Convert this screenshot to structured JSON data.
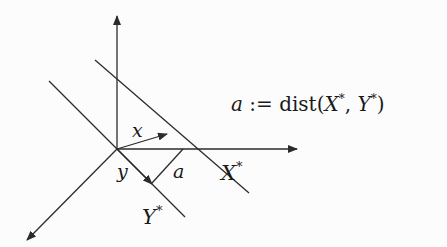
{
  "diagram": {
    "labels": {
      "x": "x",
      "y": "y",
      "a": "a",
      "x_star": "X",
      "y_star": "Y",
      "star": "*"
    },
    "definition": {
      "lhs": "a",
      "op": " := ",
      "fn": "dist",
      "open": "(",
      "arg1": "X",
      "star": "*",
      "comma": ", ",
      "arg2": "Y",
      "close": ")"
    },
    "colors": {
      "stroke": "#2b2b2b",
      "background": "#fcfcfc"
    }
  }
}
